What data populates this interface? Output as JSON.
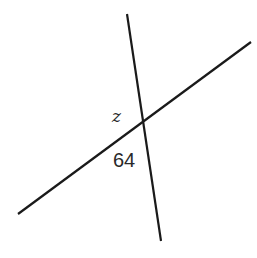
{
  "diagram": {
    "lines": [
      {
        "name": "steep-line",
        "x1": 127,
        "y1": 14,
        "x2": 161,
        "y2": 241
      },
      {
        "name": "shallow-line",
        "x1": 18,
        "y1": 214,
        "x2": 251,
        "y2": 42
      }
    ],
    "intersection": {
      "x": 143,
      "y": 123
    },
    "labels": {
      "angle_z": {
        "text": "z",
        "x": 112,
        "y": 122
      },
      "angle_64": {
        "text": "64",
        "x": 113,
        "y": 167
      }
    }
  }
}
